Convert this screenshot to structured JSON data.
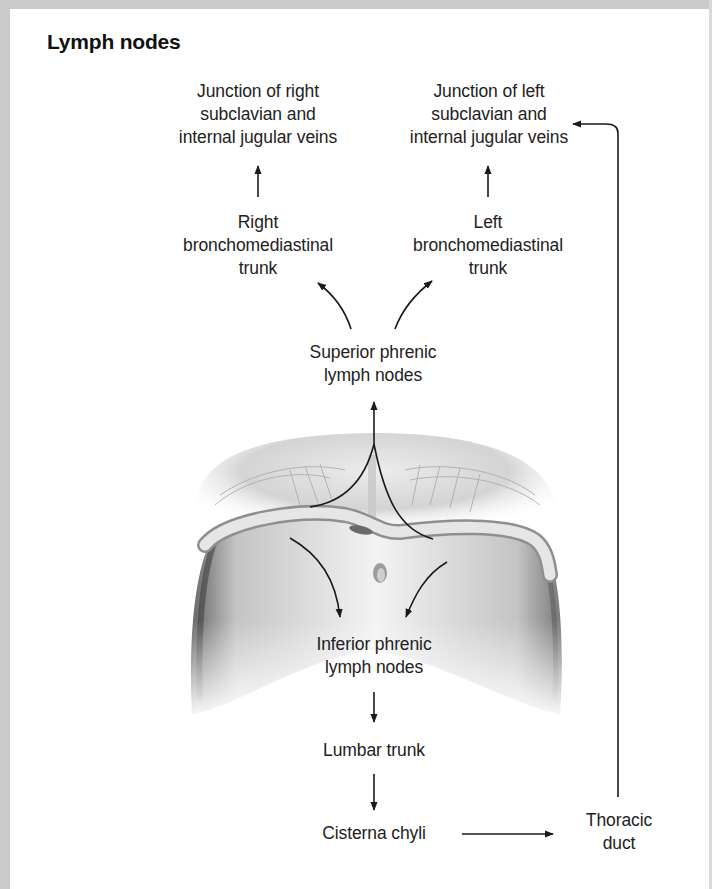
{
  "title": "Lymph nodes",
  "nodes": {
    "junction_right": {
      "lines": [
        "Junction of right",
        "subclavian and",
        "internal jugular veins"
      ]
    },
    "junction_left": {
      "lines": [
        "Junction of left",
        "subclavian and",
        "internal jugular veins"
      ]
    },
    "right_trunk": {
      "lines": [
        "Right",
        "bronchomediastinal",
        "trunk"
      ]
    },
    "left_trunk": {
      "lines": [
        "Left",
        "bronchomediastinal",
        "trunk"
      ]
    },
    "superior_phrenic": {
      "lines": [
        "Superior phrenic",
        "lymph nodes"
      ]
    },
    "inferior_phrenic": {
      "lines": [
        "Inferior phrenic",
        "lymph nodes"
      ]
    },
    "lumbar_trunk": {
      "lines": [
        "Lumbar trunk"
      ]
    },
    "cisterna_chyli": {
      "lines": [
        "Cisterna chyli"
      ]
    },
    "thoracic_duct": {
      "lines": [
        "Thoracic",
        "duct"
      ]
    }
  },
  "illustration": {
    "subject": "diaphragm-anatomy-drawing"
  },
  "colors": {
    "border": "#cbcbcb",
    "text": "#222222",
    "arrow": "#1a1a1a",
    "background": "#ffffff"
  }
}
